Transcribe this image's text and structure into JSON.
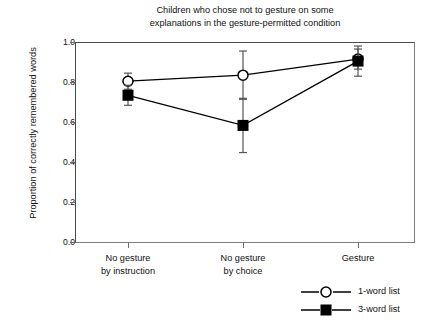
{
  "chart_data": {
    "type": "line",
    "title": "Children who chose not to gesture on some explanations in the gesture-permitted condition",
    "title_lines": [
      "Children who chose not to gesture on some",
      "explanations in the gesture-permitted condition"
    ],
    "xlabel": "",
    "ylabel": "Proportion of correctly remembered words",
    "ylim": [
      0.0,
      1.0
    ],
    "ytick_labels": [
      "0.0",
      "0.2",
      "0.4",
      "0.6",
      "0.8",
      "1.0"
    ],
    "ytick_values": [
      0.0,
      0.2,
      0.4,
      0.6,
      0.8,
      1.0
    ],
    "grid": false,
    "legend_position": "bottom-right",
    "categories": [
      "No gesture by instruction",
      "No gesture by choice",
      "Gesture"
    ],
    "category_lines": [
      [
        "No gesture",
        "by instruction"
      ],
      [
        "No gesture",
        "by choice"
      ],
      [
        "Gesture",
        ""
      ]
    ],
    "series": [
      {
        "name": "1-word list",
        "marker": "open-circle",
        "color": "#000000",
        "values": [
          0.805,
          0.835,
          0.915
        ],
        "errors": [
          0.04,
          0.12,
          0.05
        ]
      },
      {
        "name": "3-word list",
        "marker": "filled-square",
        "color": "#000000",
        "values": [
          0.735,
          0.585,
          0.905
        ],
        "errors": [
          0.05,
          0.135,
          0.075
        ]
      }
    ]
  },
  "legend": {
    "items": [
      {
        "label": "1-word list",
        "marker": "open-circle"
      },
      {
        "label": "3-word list",
        "marker": "filled-square"
      }
    ]
  },
  "colors": {
    "axis": "#4a4a4a",
    "ink": "#111111",
    "background": "#ffffff"
  }
}
